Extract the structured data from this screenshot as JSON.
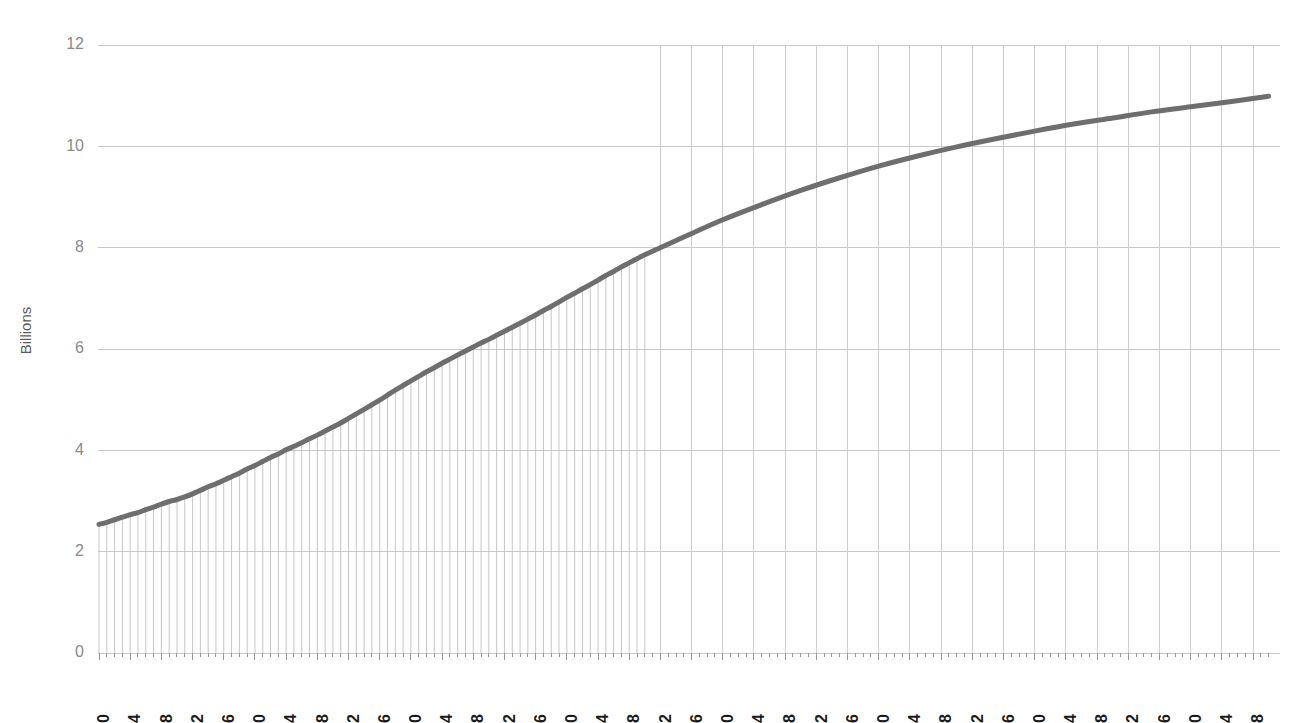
{
  "chart": {
    "title_partial": "",
    "y_axis_title": "Billions"
  },
  "chart_data": {
    "type": "line",
    "title": "",
    "xlabel": "",
    "ylabel": "Billions",
    "xlim": [
      1950,
      2100
    ],
    "ylim": [
      0,
      12
    ],
    "grid": true,
    "legend": "none",
    "line_color": "#6e6e6e",
    "gridline_color": "#c9c9c9",
    "dropline_color": "#bcbcbc",
    "dropline_range": [
      1950,
      2020
    ],
    "y_ticks": [
      0,
      2,
      4,
      6,
      8,
      10,
      12
    ],
    "y_tick_labels": [
      "0",
      "2",
      "4",
      "6",
      "8",
      "10",
      "12"
    ],
    "x_ticks": [
      1950,
      1954,
      1958,
      1962,
      1966,
      1970,
      1974,
      1978,
      1982,
      1986,
      1990,
      1994,
      1998,
      2002,
      2006,
      2010,
      2014,
      2018,
      2022,
      2026,
      2030,
      2034,
      2038,
      2042,
      2046,
      2050,
      2054,
      2058,
      2062,
      2066,
      2070,
      2074,
      2078,
      2082,
      2086,
      2090,
      2094,
      2098
    ],
    "x_tick_labels": [
      "1950",
      "1954",
      "1958",
      "1962",
      "1966",
      "1970",
      "1974",
      "1978",
      "1982",
      "1986",
      "1990",
      "1994",
      "1998",
      "2002",
      "2006",
      "2010",
      "2014",
      "2018",
      "2022",
      "2026",
      "2030",
      "2034",
      "2038",
      "2042",
      "2046",
      "2050",
      "2054",
      "2058",
      "2062",
      "2066",
      "2070",
      "2074",
      "2078",
      "2082",
      "2086",
      "2090",
      "2094",
      "2098"
    ],
    "series": [
      {
        "name": "World population",
        "x": [
          1950,
          1951,
          1952,
          1953,
          1954,
          1955,
          1956,
          1957,
          1958,
          1959,
          1960,
          1961,
          1962,
          1963,
          1964,
          1965,
          1966,
          1967,
          1968,
          1969,
          1970,
          1971,
          1972,
          1973,
          1974,
          1975,
          1976,
          1977,
          1978,
          1979,
          1980,
          1981,
          1982,
          1983,
          1984,
          1985,
          1986,
          1987,
          1988,
          1989,
          1990,
          1991,
          1992,
          1993,
          1994,
          1995,
          1996,
          1997,
          1998,
          1999,
          2000,
          2001,
          2002,
          2003,
          2004,
          2005,
          2006,
          2007,
          2008,
          2009,
          2010,
          2011,
          2012,
          2013,
          2014,
          2015,
          2016,
          2017,
          2018,
          2019,
          2020,
          2025,
          2030,
          2035,
          2040,
          2045,
          2050,
          2055,
          2060,
          2065,
          2070,
          2075,
          2080,
          2085,
          2090,
          2095,
          2100
        ],
        "values": [
          2.54,
          2.58,
          2.63,
          2.68,
          2.73,
          2.77,
          2.83,
          2.88,
          2.94,
          2.99,
          3.03,
          3.08,
          3.14,
          3.21,
          3.28,
          3.34,
          3.41,
          3.48,
          3.55,
          3.63,
          3.7,
          3.78,
          3.86,
          3.93,
          4.01,
          4.08,
          4.15,
          4.23,
          4.3,
          4.38,
          4.46,
          4.54,
          4.63,
          4.72,
          4.81,
          4.9,
          4.99,
          5.09,
          5.19,
          5.28,
          5.37,
          5.46,
          5.55,
          5.63,
          5.72,
          5.8,
          5.88,
          5.96,
          6.04,
          6.12,
          6.19,
          6.27,
          6.35,
          6.43,
          6.51,
          6.59,
          6.67,
          6.76,
          6.84,
          6.93,
          7.02,
          7.1,
          7.19,
          7.27,
          7.36,
          7.45,
          7.53,
          7.62,
          7.7,
          7.78,
          7.86,
          8.21,
          8.55,
          8.85,
          9.13,
          9.38,
          9.61,
          9.81,
          9.99,
          10.15,
          10.3,
          10.44,
          10.56,
          10.68,
          10.78,
          10.88,
          10.99
        ]
      }
    ],
    "annotations": [
      {
        "text": "Dense annual drop lines drawn for the historical period 1950-2020; sparse 4-year gridlines for the projected period 2020-2100."
      }
    ]
  }
}
